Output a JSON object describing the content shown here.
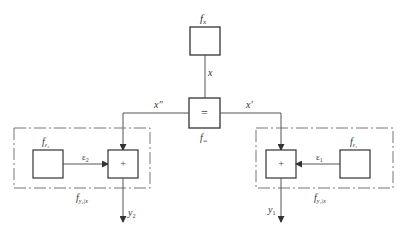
{
  "diagram": {
    "top_node": {
      "label": "f",
      "sub": "x"
    },
    "edge_top": {
      "label": "x"
    },
    "equal_node": {
      "symbol": "=",
      "label": "f",
      "sub": "="
    },
    "left_branch_edge": {
      "label": "x″"
    },
    "right_branch_edge": {
      "label": "x′"
    },
    "left_group": {
      "frame_label": "f",
      "frame_sub": "y₂|x",
      "noise_node": {
        "label": "f",
        "sub": "ε₂"
      },
      "noise_edge": {
        "label": "ε",
        "sub": "2"
      },
      "sum_node": {
        "symbol": "+"
      },
      "output": {
        "label": "y",
        "sub": "2"
      }
    },
    "right_group": {
      "frame_label": "f",
      "frame_sub": "y₁|x",
      "noise_node": {
        "label": "f",
        "sub": "ε₁"
      },
      "noise_edge": {
        "label": "ε",
        "sub": "1"
      },
      "sum_node": {
        "symbol": "+"
      },
      "output": {
        "label": "y",
        "sub": "1"
      }
    }
  }
}
